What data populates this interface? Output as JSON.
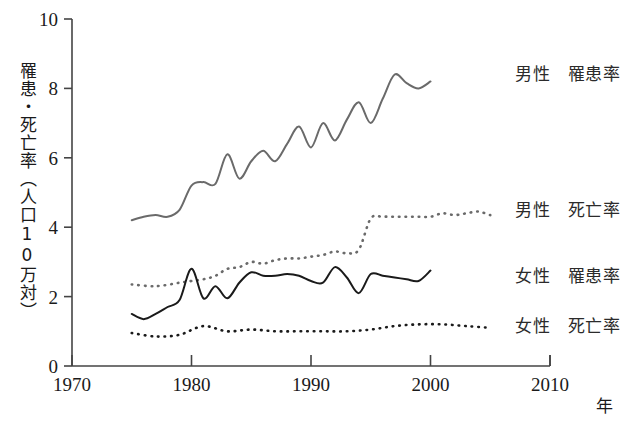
{
  "chart_data": {
    "type": "line",
    "title": "",
    "subtitle": "",
    "xlabel": "年",
    "ylabel": "罹患・死亡率（人口10万対）",
    "xlim": [
      1970,
      2010
    ],
    "ylim": [
      0,
      10
    ],
    "xticks": [
      1970,
      1980,
      1990,
      2000,
      2010
    ],
    "yticks": [
      0,
      2,
      4,
      6,
      8,
      10
    ],
    "grid": false,
    "legend_position": "right",
    "colors": {
      "male_incidence": "#6a6a6a",
      "male_mortality": "#6a6a6a",
      "female_incidence": "#1a1a1a",
      "female_mortality": "#1a1a1a",
      "axis": "#444444",
      "text": "#1a1a1a"
    },
    "series": [
      {
        "name": "男性　罹患率",
        "style": "solid",
        "color": "#6a6a6a",
        "x": [
          1975,
          1976,
          1977,
          1978,
          1979,
          1980,
          1981,
          1982,
          1983,
          1984,
          1985,
          1986,
          1987,
          1988,
          1989,
          1990,
          1991,
          1992,
          1993,
          1994,
          1995,
          1996,
          1997,
          1998,
          1999,
          2000
        ],
        "values": [
          4.2,
          4.3,
          4.35,
          4.3,
          4.5,
          5.2,
          5.3,
          5.25,
          6.1,
          5.4,
          5.9,
          6.2,
          5.9,
          6.4,
          6.9,
          6.3,
          7.0,
          6.5,
          7.1,
          7.6,
          7.0,
          7.7,
          8.4,
          8.15,
          8.0,
          8.2
        ],
        "start_value": 4.2,
        "end_value": 8.2,
        "peak_value": 8.4,
        "peak_year": 1997
      },
      {
        "name": "男性　死亡率",
        "style": "dotted",
        "color": "#6a6a6a",
        "x": [
          1975,
          1977,
          1979,
          1980,
          1981,
          1982,
          1983,
          1984,
          1985,
          1986,
          1987,
          1988,
          1989,
          1990,
          1991,
          1992,
          1993,
          1994,
          1995,
          1996,
          1997,
          1998,
          1999,
          2000,
          2001,
          2002,
          2003,
          2004,
          2005
        ],
        "values": [
          2.35,
          2.3,
          2.4,
          2.45,
          2.5,
          2.6,
          2.8,
          2.85,
          3.0,
          2.95,
          3.05,
          3.1,
          3.1,
          3.15,
          3.2,
          3.3,
          3.25,
          3.35,
          4.25,
          4.3,
          4.3,
          4.3,
          4.3,
          4.3,
          4.4,
          4.35,
          4.4,
          4.45,
          4.35
        ],
        "start_value": 2.35,
        "end_value": 4.35
      },
      {
        "name": "女性　罹患率",
        "style": "solid",
        "color": "#1a1a1a",
        "x": [
          1975,
          1976,
          1977,
          1978,
          1979,
          1980,
          1981,
          1982,
          1983,
          1984,
          1985,
          1986,
          1987,
          1988,
          1989,
          1990,
          1991,
          1992,
          1993,
          1994,
          1995,
          1996,
          1997,
          1998,
          1999,
          2000
        ],
        "values": [
          1.5,
          1.35,
          1.5,
          1.7,
          1.9,
          2.8,
          1.95,
          2.3,
          1.95,
          2.4,
          2.7,
          2.6,
          2.6,
          2.65,
          2.6,
          2.45,
          2.4,
          2.85,
          2.55,
          2.1,
          2.65,
          2.6,
          2.55,
          2.5,
          2.45,
          2.75
        ],
        "start_value": 1.5,
        "end_value": 2.75,
        "peak_value": 2.85,
        "peak_year": 1992
      },
      {
        "name": "女性　死亡率",
        "style": "dotted",
        "color": "#1a1a1a",
        "x": [
          1975,
          1977,
          1979,
          1981,
          1983,
          1985,
          1987,
          1989,
          1991,
          1993,
          1995,
          1997,
          1999,
          2001,
          2003,
          2005
        ],
        "values": [
          0.95,
          0.85,
          0.9,
          1.15,
          1.0,
          1.05,
          1.0,
          1.0,
          1.0,
          1.0,
          1.05,
          1.15,
          1.2,
          1.2,
          1.15,
          1.1
        ],
        "start_value": 0.95,
        "end_value": 1.1
      }
    ]
  },
  "legend": {
    "items": [
      {
        "label": "男性　罹患率",
        "style": "solid",
        "color": "#6a6a6a",
        "has_sample": false
      },
      {
        "label": "男性　死亡率",
        "style": "dotted",
        "color": "#6a6a6a",
        "has_sample": false
      },
      {
        "label": "女性　罹患率",
        "style": "solid",
        "color": "#1a1a1a",
        "has_sample": false
      },
      {
        "label": "女性　死亡率",
        "style": "dotted",
        "color": "#1a1a1a",
        "has_sample": false
      }
    ]
  },
  "axes": {
    "y_title": "罹患・死亡率（人口10万対）",
    "x_unit": "年",
    "y_ticks": [
      "10",
      "8",
      "6",
      "4",
      "2",
      "0"
    ],
    "x_ticks": [
      "1970",
      "1980",
      "1990",
      "2000",
      "2010"
    ]
  }
}
